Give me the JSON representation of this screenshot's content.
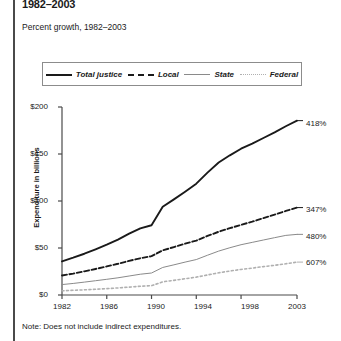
{
  "title": "1982–2003",
  "subtitle": "Percent growth, 1982–2003",
  "note": "Note: Does not include indirect expenditures.",
  "legend": {
    "items": [
      {
        "label": "Total justice",
        "style": "solid-thick",
        "color": "#1a1a1a",
        "swatch": "line-swatch-total"
      },
      {
        "label": "Local",
        "style": "dashed",
        "color": "#1a1a1a",
        "swatch": "line-swatch-local"
      },
      {
        "label": "State",
        "style": "solid-thin",
        "color": "#8a8a8a",
        "swatch": "line-swatch-state"
      },
      {
        "label": "Federal",
        "style": "dotted",
        "color": "#b0b0b0",
        "swatch": "line-swatch-federal"
      }
    ]
  },
  "axes": {
    "ylabel": "Expenditure in billions",
    "yticks": [
      "$0",
      "$50",
      "$100",
      "$150",
      "$200"
    ],
    "xticks": [
      "1982",
      "1986",
      "1990",
      "1994",
      "1998",
      "2003"
    ]
  },
  "end_labels": [
    "418%",
    "347%",
    "480%",
    "607%"
  ],
  "chart_data": {
    "type": "line",
    "title": "1982–2003",
    "subtitle": "Percent growth, 1982–2003",
    "xlabel": "",
    "ylabel": "Expenditure in billions",
    "xlim": [
      1982,
      2003
    ],
    "ylim": [
      0,
      200
    ],
    "grid": false,
    "legend_position": "top",
    "xticks": [
      1982,
      1986,
      1990,
      1994,
      1998,
      2003
    ],
    "ytick_values": [
      0,
      50,
      100,
      150,
      200
    ],
    "ytick_labels": [
      "$0",
      "$50",
      "$100",
      "$150",
      "$200"
    ],
    "x": [
      1982,
      1983,
      1984,
      1985,
      1986,
      1987,
      1988,
      1989,
      1990,
      1991,
      1992,
      1993,
      1994,
      1995,
      1996,
      1997,
      1998,
      1999,
      2000,
      2001,
      2002,
      2003
    ],
    "series": [
      {
        "name": "Total justice",
        "style": "solid-thick",
        "color": "#1a1a1a",
        "end_label": "418%",
        "values": [
          35.8,
          39.7,
          43.9,
          48.6,
          53.5,
          58.9,
          65.2,
          70.9,
          74.2,
          93.8,
          101.7,
          109.9,
          118.4,
          130.2,
          141.0,
          148.6,
          155.6,
          161.0,
          167.0,
          173.0,
          179.5,
          185.5
        ]
      },
      {
        "name": "Local",
        "style": "dashed",
        "color": "#1a1a1a",
        "end_label": "347%",
        "values": [
          20.8,
          22.8,
          25.2,
          27.7,
          30.4,
          33.2,
          36.3,
          39.1,
          41.3,
          47.5,
          51.0,
          54.6,
          57.9,
          62.8,
          67.3,
          71.1,
          74.6,
          78.0,
          81.8,
          85.5,
          89.4,
          93.0
        ]
      },
      {
        "name": "State",
        "style": "solid-thin",
        "color": "#8a8a8a",
        "end_label": "480%",
        "values": [
          11.1,
          12.3,
          13.7,
          15.2,
          16.7,
          18.3,
          20.2,
          22.1,
          23.4,
          29.3,
          32.1,
          35.0,
          37.7,
          42.3,
          46.7,
          50.3,
          53.5,
          56.0,
          58.5,
          61.0,
          63.4,
          64.5
        ]
      },
      {
        "name": "Federal",
        "style": "dotted",
        "color": "#b0b0b0",
        "end_label": "607%",
        "values": [
          4.5,
          5.0,
          5.5,
          6.1,
          6.8,
          7.5,
          8.4,
          9.3,
          9.9,
          14.0,
          15.6,
          17.3,
          19.0,
          21.3,
          23.6,
          25.5,
          27.2,
          28.6,
          30.2,
          31.6,
          33.2,
          35.0
        ]
      }
    ]
  }
}
